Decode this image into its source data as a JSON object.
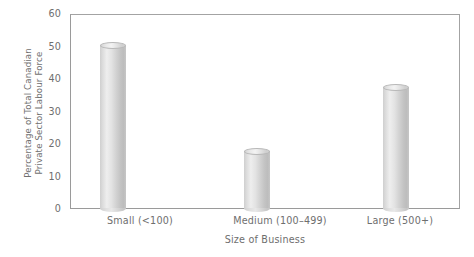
{
  "chart_data": {
    "type": "bar",
    "title": "",
    "subtitle": "",
    "categories": [
      "Small (<100)",
      "Medium (100–499)",
      "Large (500+)"
    ],
    "values": [
      50,
      17.5,
      37
    ],
    "xlabel": "Size of Business",
    "ylabel": "Percentage of Total Canadian Private Sector Labour Force",
    "ylabel_lines": [
      "Percentage of Total Canadian",
      "Private Sector Labour Force"
    ],
    "ylim": [
      0,
      60
    ],
    "yticks": [
      0,
      10,
      20,
      30,
      40,
      50,
      60
    ],
    "ytick_labels": [
      "0",
      "10",
      "20",
      "30",
      "40",
      "50",
      "60"
    ],
    "grid": false,
    "legend": false,
    "legend_position": "none",
    "bar_style": "cylinder",
    "colors": {
      "bar_fill_light": "#eeeeee",
      "bar_fill_mid": "#d8d8d8",
      "bar_fill_dark": "#bdbdbd",
      "axis_line": "#9a9a9a",
      "text": "#6e6e6e",
      "background": "#ffffff"
    }
  },
  "axes": {
    "y": {
      "title_line1": "Percentage of Total Canadian",
      "title_line2": "Private Sector Labour Force",
      "ticks": [
        {
          "label": "60",
          "value": 60
        },
        {
          "label": "50",
          "value": 50
        },
        {
          "label": "40",
          "value": 40
        },
        {
          "label": "30",
          "value": 30
        },
        {
          "label": "20",
          "value": 20
        },
        {
          "label": "10",
          "value": 10
        },
        {
          "label": "0",
          "value": 0
        }
      ]
    },
    "x": {
      "title": "Size of Business",
      "ticks": [
        {
          "label": "Small (<100)"
        },
        {
          "label": "Medium (100–499)"
        },
        {
          "label": "Large (500+)"
        }
      ]
    }
  }
}
